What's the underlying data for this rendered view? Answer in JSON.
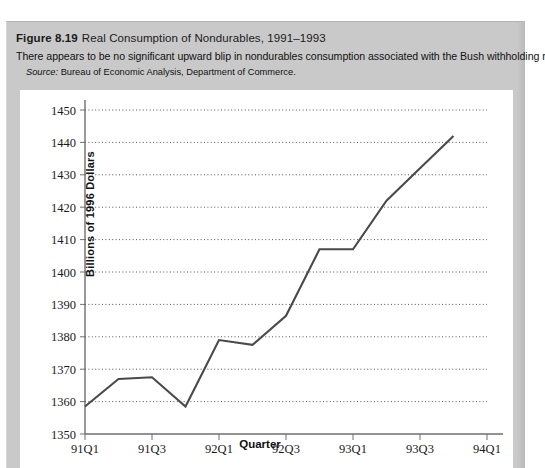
{
  "figure": {
    "number": "Figure 8.19",
    "title": "Real Consumption of Nondurables, 1991–1993",
    "description": "There appears to be no significant upward blip in nondurables consumption associated with the Bush withholding reduction.",
    "source_label": "Source:",
    "source_text": "Bureau of Economic Analysis, Department of Commerce."
  },
  "chart_data": {
    "type": "line",
    "title": "Real Consumption of Nondurables, 1991–1993",
    "xlabel": "Quarter",
    "ylabel": "Billions of 1996 Dollars",
    "x": [
      "91Q1",
      "91Q2",
      "91Q3",
      "91Q4",
      "92Q1",
      "92Q2",
      "92Q3",
      "92Q4",
      "93Q1",
      "93Q2",
      "93Q3",
      "93Q4"
    ],
    "values": [
      1358.5,
      1367,
      1367.5,
      1358.5,
      1379,
      1377.5,
      1386.5,
      1407,
      1407,
      1422,
      1432,
      1442
    ],
    "ylim": [
      1350,
      1450
    ],
    "ytick_labels": [
      "1450",
      "1440",
      "1430",
      "1420",
      "1410",
      "1400",
      "1390",
      "1380",
      "1370",
      "1360",
      "1350"
    ],
    "ytick_values": [
      1450,
      1440,
      1430,
      1420,
      1410,
      1400,
      1390,
      1380,
      1370,
      1360,
      1350
    ],
    "xtick_labels": [
      "91Q1",
      "91Q3",
      "92Q1",
      "92Q3",
      "93Q1",
      "93Q3",
      "94Q1"
    ],
    "xtick_positions": [
      0,
      2,
      4,
      6,
      8,
      10,
      12
    ],
    "xlim_quarters": [
      0,
      12
    ],
    "grid": "horizontal-dotted",
    "legend": "none",
    "line_color": "#4a4a4a",
    "grid_color": "#555555",
    "axis_color": "#6e6e6e"
  }
}
